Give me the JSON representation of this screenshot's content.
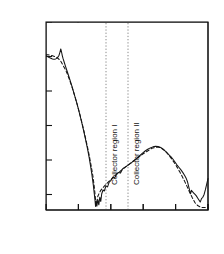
{
  "chart_data": {
    "type": "line",
    "title": "Poly-Mono interface",
    "xlabel": "Distance [ um ]",
    "ylabel": "Net Conc [ cm",
    "ylabel_sup": "-3",
    "ylabel_tail": " ]",
    "xlim": [
      0,
      2.5
    ],
    "ylim_log": [
      15.55,
      21.0
    ],
    "yscale": "log",
    "grid": false,
    "legend": "none",
    "xticks": [
      0,
      0.5,
      1.0,
      1.5,
      2.0,
      2.5
    ],
    "xticklabels": [
      "",
      "0.5",
      "1.0",
      "1.5",
      "2.0",
      "2.5"
    ],
    "yticks_exp": [
      21,
      20,
      19,
      18,
      17,
      16
    ],
    "yticklabels": [
      "10",
      "10",
      "10",
      "10",
      "10",
      "10"
    ],
    "ytick_sups": [
      "21",
      "20",
      "19",
      "18",
      "17",
      "16"
    ],
    "annotations": [
      {
        "name": "poly-mono-interface",
        "text": "Poly-Mono interface",
        "x": 0.12,
        "arrow": true
      },
      {
        "name": "collector-region-1",
        "text": "Collector region I",
        "x": 0.93,
        "rotated": true
      },
      {
        "name": "collector-region-2",
        "text": "Collector region II",
        "x": 1.33,
        "rotated": true
      }
    ],
    "vlines": [
      {
        "name": "region-divider-dotted",
        "x": 1.255,
        "style": "dotted"
      },
      {
        "name": "region-label-guide",
        "x": 0.88,
        "style": "dotted"
      }
    ],
    "series": [
      {
        "name": "measured-SIMS-solid",
        "style": "solid",
        "points": [
          [
            0.0,
            20.02
          ],
          [
            0.025,
            20.0
          ],
          [
            0.05,
            19.97
          ],
          [
            0.075,
            19.95
          ],
          [
            0.1,
            19.93
          ],
          [
            0.125,
            19.92
          ],
          [
            0.15,
            19.93
          ],
          [
            0.175,
            19.96
          ],
          [
            0.2,
            20.03
          ],
          [
            0.215,
            20.12
          ],
          [
            0.228,
            20.22
          ],
          [
            0.24,
            20.13
          ],
          [
            0.252,
            20.02
          ],
          [
            0.265,
            19.93
          ],
          [
            0.28,
            19.84
          ],
          [
            0.3,
            19.72
          ],
          [
            0.33,
            19.55
          ],
          [
            0.36,
            19.38
          ],
          [
            0.4,
            19.14
          ],
          [
            0.44,
            18.88
          ],
          [
            0.48,
            18.62
          ],
          [
            0.52,
            18.33
          ],
          [
            0.55,
            18.1
          ],
          [
            0.58,
            17.86
          ],
          [
            0.61,
            17.6
          ],
          [
            0.64,
            17.33
          ],
          [
            0.665,
            17.08
          ],
          [
            0.69,
            16.8
          ],
          [
            0.71,
            16.55
          ],
          [
            0.73,
            16.28
          ],
          [
            0.745,
            16.02
          ],
          [
            0.757,
            15.82
          ],
          [
            0.765,
            15.65
          ],
          [
            0.775,
            15.8
          ],
          [
            0.785,
            15.66
          ],
          [
            0.8,
            15.85
          ],
          [
            0.815,
            15.7
          ],
          [
            0.83,
            15.92
          ],
          [
            0.845,
            15.8
          ],
          [
            0.86,
            16.02
          ],
          [
            0.88,
            16.13
          ],
          [
            0.9,
            16.1
          ],
          [
            0.925,
            16.25
          ],
          [
            0.95,
            16.22
          ],
          [
            0.975,
            16.36
          ],
          [
            1.0,
            16.4
          ],
          [
            1.03,
            16.5
          ],
          [
            1.06,
            16.48
          ],
          [
            1.09,
            16.6
          ],
          [
            1.12,
            16.64
          ],
          [
            1.15,
            16.62
          ],
          [
            1.18,
            16.74
          ],
          [
            1.21,
            16.78
          ],
          [
            1.25,
            16.83
          ],
          [
            1.29,
            16.88
          ],
          [
            1.33,
            16.94
          ],
          [
            1.37,
            17.0
          ],
          [
            1.41,
            17.06
          ],
          [
            1.45,
            17.13
          ],
          [
            1.49,
            17.2
          ],
          [
            1.53,
            17.26
          ],
          [
            1.57,
            17.31
          ],
          [
            1.61,
            17.35
          ],
          [
            1.65,
            17.38
          ],
          [
            1.69,
            17.4
          ],
          [
            1.73,
            17.39
          ],
          [
            1.77,
            17.36
          ],
          [
            1.81,
            17.31
          ],
          [
            1.85,
            17.24
          ],
          [
            1.89,
            17.16
          ],
          [
            1.93,
            17.09
          ],
          [
            1.96,
            17.02
          ],
          [
            1.99,
            16.94
          ],
          [
            2.02,
            16.86
          ],
          [
            2.05,
            16.79
          ],
          [
            2.08,
            16.72
          ],
          [
            2.11,
            16.64
          ],
          [
            2.14,
            16.55
          ],
          [
            2.165,
            16.46
          ],
          [
            2.185,
            16.36
          ],
          [
            2.2,
            16.24
          ],
          [
            2.215,
            16.13
          ],
          [
            2.23,
            16.02
          ],
          [
            2.245,
            16.12
          ],
          [
            2.26,
            16.08
          ],
          [
            2.28,
            16.04
          ],
          [
            2.3,
            16.0
          ],
          [
            2.32,
            15.96
          ],
          [
            2.34,
            15.9
          ],
          [
            2.36,
            15.84
          ],
          [
            2.38,
            15.78
          ],
          [
            2.4,
            15.88
          ],
          [
            2.42,
            15.92
          ],
          [
            2.44,
            16.0
          ],
          [
            2.46,
            16.14
          ],
          [
            2.48,
            16.3
          ],
          [
            2.5,
            16.46
          ]
        ]
      },
      {
        "name": "simulated-dashed",
        "style": "dashed",
        "points": [
          [
            0.0,
            20.05
          ],
          [
            0.03,
            20.05
          ],
          [
            0.06,
            20.04
          ],
          [
            0.09,
            20.03
          ],
          [
            0.12,
            20.01
          ],
          [
            0.15,
            19.99
          ],
          [
            0.175,
            19.96
          ],
          [
            0.2,
            19.92
          ],
          [
            0.22,
            19.88
          ],
          [
            0.235,
            19.84
          ],
          [
            0.25,
            19.79
          ],
          [
            0.27,
            19.72
          ],
          [
            0.3,
            19.62
          ],
          [
            0.33,
            19.49
          ],
          [
            0.36,
            19.34
          ],
          [
            0.4,
            19.12
          ],
          [
            0.44,
            18.88
          ],
          [
            0.48,
            18.62
          ],
          [
            0.52,
            18.34
          ],
          [
            0.56,
            18.04
          ],
          [
            0.6,
            17.72
          ],
          [
            0.64,
            17.38
          ],
          [
            0.67,
            17.1
          ],
          [
            0.7,
            16.8
          ],
          [
            0.725,
            16.52
          ],
          [
            0.745,
            16.22
          ],
          [
            0.76,
            15.94
          ],
          [
            0.772,
            15.7
          ],
          [
            0.785,
            15.8
          ],
          [
            0.8,
            15.95
          ],
          [
            0.82,
            16.03
          ],
          [
            0.845,
            16.12
          ],
          [
            0.87,
            16.18
          ],
          [
            0.9,
            16.24
          ],
          [
            0.93,
            16.3
          ],
          [
            0.96,
            16.36
          ],
          [
            1.0,
            16.43
          ],
          [
            1.05,
            16.52
          ],
          [
            1.1,
            16.6
          ],
          [
            1.15,
            16.68
          ],
          [
            1.2,
            16.76
          ],
          [
            1.25,
            16.83
          ],
          [
            1.3,
            16.9
          ],
          [
            1.35,
            16.97
          ],
          [
            1.4,
            17.04
          ],
          [
            1.45,
            17.11
          ],
          [
            1.5,
            17.18
          ],
          [
            1.55,
            17.24
          ],
          [
            1.6,
            17.3
          ],
          [
            1.65,
            17.35
          ],
          [
            1.7,
            17.37
          ],
          [
            1.74,
            17.37
          ],
          [
            1.78,
            17.34
          ],
          [
            1.82,
            17.29
          ],
          [
            1.86,
            17.22
          ],
          [
            1.9,
            17.13
          ],
          [
            1.94,
            17.03
          ],
          [
            1.98,
            16.92
          ],
          [
            2.02,
            16.8
          ],
          [
            2.06,
            16.67
          ],
          [
            2.1,
            16.53
          ],
          [
            2.14,
            16.38
          ],
          [
            2.18,
            16.22
          ],
          [
            2.22,
            16.05
          ],
          [
            2.26,
            15.9
          ],
          [
            2.3,
            15.76
          ],
          [
            2.34,
            15.68
          ],
          [
            2.38,
            15.64
          ],
          [
            2.42,
            15.62
          ],
          [
            2.46,
            15.62
          ],
          [
            2.5,
            15.63
          ]
        ]
      }
    ]
  }
}
